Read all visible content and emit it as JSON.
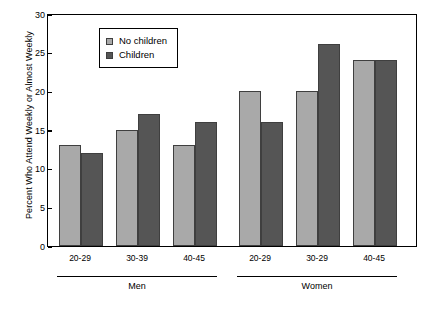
{
  "chart_data": {
    "type": "bar",
    "title": "",
    "xlabel": "",
    "ylabel": "Percent Who Attend Weekly or Almost Weekly",
    "ylim": [
      0,
      30
    ],
    "yticks": [
      0,
      5,
      10,
      15,
      20,
      25,
      30
    ],
    "grid": false,
    "legend_position": "upper-left-inside",
    "categories": [
      "20-29",
      "30-39",
      "40-45",
      "20-29",
      "30-29",
      "40-45"
    ],
    "groups": [
      {
        "label": "Men",
        "categories": [
          "20-29",
          "30-39",
          "40-45"
        ]
      },
      {
        "label": "Women",
        "categories": [
          "20-29",
          "30-29",
          "40-45"
        ]
      }
    ],
    "series": [
      {
        "name": "No children",
        "color": "#a9a9a9",
        "values": [
          13,
          15,
          13,
          20,
          20,
          24
        ]
      },
      {
        "name": "Children",
        "color": "#555555",
        "values": [
          12,
          17,
          16,
          16,
          26,
          24
        ]
      }
    ]
  },
  "legend": {
    "items": [
      {
        "label": "No children",
        "swatch": "legend-swatch-no-children"
      },
      {
        "label": "Children",
        "swatch": "legend-swatch-children"
      }
    ]
  },
  "caption": {
    "text": ""
  }
}
